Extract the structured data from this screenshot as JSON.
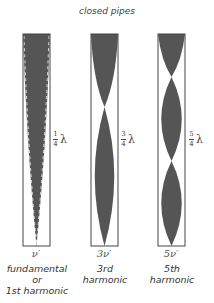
{
  "title": "closed pipes",
  "pipes": [
    {
      "length_label_num": "1",
      "length_label_den": "4",
      "length_label_symbol": "λ",
      "frequency": "ν′",
      "caption_line1": "fundamental",
      "caption_line2": "or",
      "caption_line3": "1st harmonic"
    },
    {
      "length_label_num": "3",
      "length_label_den": "4",
      "length_label_symbol": "λ",
      "frequency": "3ν′",
      "caption_line1": "3rd",
      "caption_line2": "harmonic",
      "caption_line3": ""
    },
    {
      "length_label_num": "5",
      "length_label_den": "4",
      "length_label_symbol": "λ",
      "frequency": "5ν′",
      "caption_line1": "5th",
      "caption_line2": "harmonic",
      "caption_line3": ""
    }
  ],
  "colors": {
    "wave_fill": "#555555",
    "pipe_outline": "#444444",
    "background": "#ffffff"
  }
}
